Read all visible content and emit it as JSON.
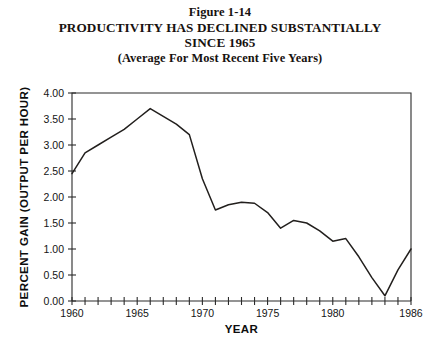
{
  "title": {
    "line1": "Figure 1-14",
    "line2": "PRODUCTIVITY HAS DECLINED SUBSTANTIALLY",
    "line3": "SINCE 1965",
    "line4": "(Average For Most Recent Five Years)"
  },
  "chart_data": {
    "type": "line",
    "title": "PRODUCTIVITY HAS DECLINED SUBSTANTIALLY SINCE 1965",
    "subtitle": "(Average For Most Recent Five Years)",
    "figure_number": "Figure 1-14",
    "xlabel": "YEAR",
    "ylabel": "PERCENT GAIN  (OUTPUT PER HOUR)",
    "xlim": [
      1960,
      1986
    ],
    "ylim": [
      0.0,
      4.0
    ],
    "grid": false,
    "legend": null,
    "x_tick_step": 1,
    "x_label_step": 5,
    "x_tick_labels": [
      "1960",
      "1965",
      "1970",
      "1975",
      "1980",
      "1986"
    ],
    "x_tick_label_values": [
      1960,
      1965,
      1970,
      1975,
      1980,
      1986
    ],
    "y_tick_labels": [
      "0.00",
      "0.50",
      "1.00",
      "1.50",
      "2.00",
      "2.50",
      "3.00",
      "3.50",
      "4.00"
    ],
    "y_tick_values": [
      0.0,
      0.5,
      1.0,
      1.5,
      2.0,
      2.5,
      3.0,
      3.5,
      4.0
    ],
    "line_color": "#221f1d",
    "x": [
      1960,
      1961,
      1962,
      1963,
      1964,
      1965,
      1966,
      1967,
      1968,
      1969,
      1970,
      1971,
      1972,
      1973,
      1974,
      1975,
      1976,
      1977,
      1978,
      1979,
      1980,
      1981,
      1982,
      1983,
      1984,
      1985,
      1986
    ],
    "values": [
      2.45,
      2.85,
      3.0,
      3.15,
      3.3,
      3.5,
      3.7,
      3.55,
      3.4,
      3.2,
      2.35,
      1.75,
      1.85,
      1.9,
      1.88,
      1.7,
      1.4,
      1.55,
      1.5,
      1.35,
      1.15,
      1.2,
      0.85,
      0.45,
      0.1,
      0.6,
      1.0
    ],
    "series": [
      {
        "name": "Percent gain in output per hour",
        "x": [
          1960,
          1961,
          1962,
          1963,
          1964,
          1965,
          1966,
          1967,
          1968,
          1969,
          1970,
          1971,
          1972,
          1973,
          1974,
          1975,
          1976,
          1977,
          1978,
          1979,
          1980,
          1981,
          1982,
          1983,
          1984,
          1985,
          1986
        ],
        "values": [
          2.45,
          2.85,
          3.0,
          3.15,
          3.3,
          3.5,
          3.7,
          3.55,
          3.4,
          3.2,
          2.35,
          1.75,
          1.85,
          1.9,
          1.88,
          1.7,
          1.4,
          1.55,
          1.5,
          1.35,
          1.15,
          1.2,
          0.85,
          0.45,
          0.1,
          0.6,
          1.0
        ]
      }
    ],
    "notable_points": {
      "peak_year": 1966,
      "peak_value": 3.7,
      "minimum_year": 1984,
      "minimum_value": 0.1,
      "start_value": 2.45,
      "end_value": 1.35
    }
  }
}
